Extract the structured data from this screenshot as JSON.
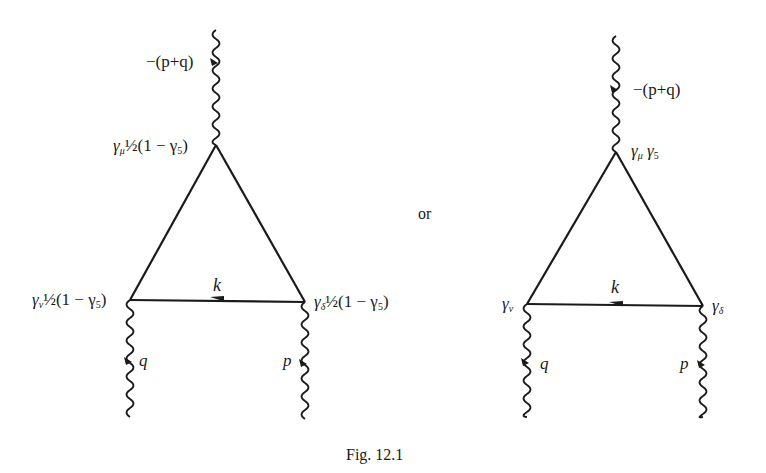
{
  "figure": {
    "caption": "Fig. 12.1",
    "separator": "or",
    "colors": {
      "ink": "#1a1a1a",
      "background": "#ffffff"
    }
  },
  "diagrams": [
    {
      "id": "left",
      "description": "Triangle fermion loop with V-A vertices",
      "vertices": {
        "top": {
          "x": 216,
          "y": 145,
          "gamma": "γ",
          "index": "μ",
          "factor": "½(1 − γ",
          "factor_sub": "5",
          "factor_close": ")"
        },
        "bottom_left": {
          "x": 130,
          "y": 300,
          "gamma": "γ",
          "index": "ν",
          "factor": "½(1 − γ",
          "factor_sub": "5",
          "factor_close": ")"
        },
        "bottom_right": {
          "x": 305,
          "y": 302,
          "gamma": "γ",
          "index": "δ",
          "factor": "½(1 − γ",
          "factor_sub": "5",
          "factor_close": ")"
        }
      },
      "loop_momentum": "k",
      "external_lines": [
        {
          "position": "top",
          "momentum": "−(p+q)"
        },
        {
          "position": "bottom_left",
          "momentum": "q"
        },
        {
          "position": "bottom_right",
          "momentum": "p"
        }
      ]
    },
    {
      "id": "right",
      "description": "Triangle fermion loop with axial vertex",
      "vertices": {
        "top": {
          "x": 616,
          "y": 152,
          "gamma": "γ",
          "index": "μ",
          "factor": "γ",
          "factor_sub": "5"
        },
        "bottom_left": {
          "x": 527,
          "y": 304,
          "gamma": "γ",
          "index": "ν"
        },
        "bottom_right": {
          "x": 703,
          "y": 306,
          "gamma": "γ",
          "index": "δ"
        }
      },
      "loop_momentum": "k",
      "external_lines": [
        {
          "position": "top",
          "momentum": "−(p+q)"
        },
        {
          "position": "bottom_left",
          "momentum": "q"
        },
        {
          "position": "bottom_right",
          "momentum": "p"
        }
      ]
    }
  ]
}
